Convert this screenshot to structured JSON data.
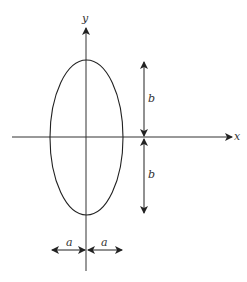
{
  "diagram": {
    "type": "ellipse-with-semi-axes",
    "labels": {
      "x_axis": "x",
      "y_axis": "y",
      "semi_major_top": "b",
      "semi_major_bottom": "b",
      "semi_minor_left": "a",
      "semi_minor_right": "a"
    },
    "colors": {
      "stroke": "#222222",
      "background": "#ffffff"
    }
  }
}
